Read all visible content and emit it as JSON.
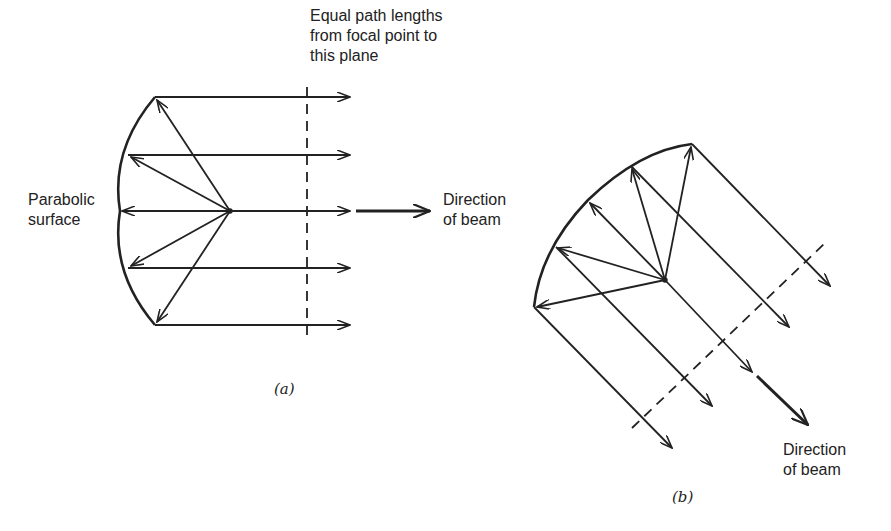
{
  "figure": {
    "panel_a": {
      "label": "(a)",
      "plane_label": [
        "Equal path lengths",
        "from focal point to",
        "this plane"
      ],
      "surface_label": [
        "Parabolic",
        "surface"
      ],
      "beam_label": [
        "Direction",
        "of beam"
      ],
      "dish_points": [
        [
          155,
          97
        ],
        [
          128,
          155
        ],
        [
          120,
          211
        ],
        [
          128,
          268
        ],
        [
          155,
          325
        ]
      ],
      "focal_point": [
        230,
        211
      ],
      "ray_end_x": 350,
      "plane_x": 307
    },
    "panel_b": {
      "label": "(b)",
      "beam_label": [
        "Direction",
        "of beam"
      ],
      "dish_points": [
        [
          692,
          144
        ],
        [
          631,
          166
        ],
        [
          588,
          200
        ],
        [
          556,
          247
        ],
        [
          534,
          307
        ]
      ],
      "focal_point": [
        665,
        280
      ],
      "ray_ends": [
        [
          830,
          286
        ],
        [
          789,
          327
        ],
        [
          752,
          372
        ],
        [
          712,
          406
        ],
        [
          672,
          448
        ]
      ]
    },
    "colors": {
      "stroke": "#222222",
      "background": "#ffffff"
    }
  }
}
